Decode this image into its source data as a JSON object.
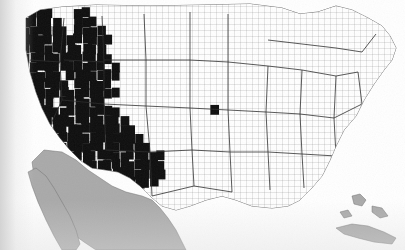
{
  "figure": {
    "kind": "choropleth-map",
    "region": "Contiguous United States",
    "unit": "county",
    "title": "",
    "caption": "",
    "has_legend": false,
    "has_axis": false,
    "has_text_labels": false
  },
  "colors": {
    "shaded_county": "#0d0d0d",
    "unshaded_county": "#ffffff",
    "county_border": "#585858",
    "state_border": "#2b2b2b",
    "non_us_land": "#a9a9a9",
    "great_lakes": "#a9a9a9",
    "ocean": "#ffffff",
    "page_background": "#ffffff"
  },
  "legend_implied": {
    "classes": [
      {
        "label": "shaded",
        "swatch": "#0d0d0d"
      },
      {
        "label": "unshaded",
        "swatch": "#ffffff"
      },
      {
        "label": "outside study area",
        "swatch": "#a9a9a9"
      }
    ]
  },
  "chart_data": {
    "type": "heatmap",
    "title": "",
    "xlabel": "",
    "ylabel": "",
    "grid": false,
    "legend_position": "none",
    "encoding": "binary",
    "value_labels": [
      "unshaded",
      "shaded"
    ],
    "note": "County-level binary shading. Grid below is a coarse raster sampling of the shaded (1) vs unshaded (0) pattern across the contiguous United States, row 0 = northern border, column 0 = Pacific coast. Cells outside the US land area are null.",
    "grid_cols": 54,
    "grid_rows": 30,
    "regional_summary": [
      {
        "region": "Pacific Northwest (WA, OR, ID)",
        "fill": "heavily shaded"
      },
      {
        "region": "California / Nevada",
        "fill": "heavily shaded"
      },
      {
        "region": "Northern Rockies (MT, WY)",
        "fill": "mixed, largely shaded"
      },
      {
        "region": "Southwest (AZ, NM, UT, CO)",
        "fill": "heavily shaded"
      },
      {
        "region": "Great Plains (KS, OK, NE, NDakota)",
        "fill": "mixed; dense shading in KS/OK"
      },
      {
        "region": "North Texas / Panhandle",
        "fill": "heavily shaded"
      },
      {
        "region": "South Texas",
        "fill": "mostly unshaded"
      },
      {
        "region": "Upper Midwest (MN, WI, MI)",
        "fill": "mostly unshaded"
      },
      {
        "region": "Corn Belt (IA, IL, IN, OH)",
        "fill": "mostly unshaded, scattered shading"
      },
      {
        "region": "Mid-South (MO, AR, TN, KY)",
        "fill": "scattered shading"
      },
      {
        "region": "Southeast (GA, AL, SC, NC, FL)",
        "fill": "mostly unshaded"
      },
      {
        "region": "Northeast (NY, PA, New England)",
        "fill": "mostly unshaded, isolated shaded counties"
      }
    ],
    "rows": [
      "...000000..00000000000000000000000000000000000000000...",
      "..0111100.1100000000000000000000000000000000000000000.",
      "..0111110.1110000000000000000000000000000.000000000000",
      "..1111111.1111000000000000000000000000000.000000000000",
      "..0111111111111000000000000000000..000000000000000000.",
      "..1111111111110000000000000000000..00000000000000000..",
      ".11111111111111000000000000000000..000000000000000000.",
      ".01111111111110100000000000000000..00000000000000000..",
      ".11111110111111100000000000000000..0000000000000000...",
      ".01111111011111000000000000000000..000000000000000....",
      ".11111111111111100000000000000000.0000000000000000....",
      ".01111101111110000000000000000000.00000000000000000...",
      ".11111111111111100000000000010000000000000000000000...",
      ".01111111111111110000000000000000000000000000000000...",
      ".11111111111111111000000000000000000000000000000000...",
      ".01111011111111111100000000000000000000000000000000...",
      ".11111111111111111110000000000000000000000000000000...",
      "..1111111111111111111100000000000000000000000000000..",
      "..0111111111111111111100000000000000000000000000000..",
      "...11111111111111111110000000000000000000000000000...",
      "...0111111111111111110000000000000000000000000000....",
      "....11111111111111100000000000000000000000000000.....",
      ".....111111111111000000000000000000000000000000......",
      "......0011111110000000000000000000000000000000.......",
      ".......000011100000000000000000000000000000..........",
      "........0000100000000000000000000000000..............",
      "..........000000000000000000000000000................",
      "...........0000000000000000000000...................."
    ]
  }
}
